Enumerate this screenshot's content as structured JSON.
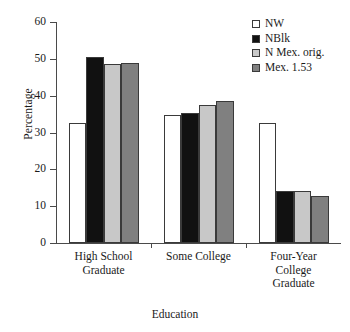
{
  "chart_data": {
    "type": "bar",
    "title": "",
    "xlabel": "Education",
    "ylabel": "Percentage",
    "categories": [
      "High School Graduate",
      "Some College",
      "Four-Year College Graduate"
    ],
    "category_lines": [
      [
        "High School",
        "Graduate"
      ],
      [
        "Some College"
      ],
      [
        "Four-Year",
        "College",
        "Graduate"
      ]
    ],
    "series": [
      {
        "name": "NW",
        "color": "#ffffff",
        "values": [
          32.6,
          34.8,
          32.6
        ]
      },
      {
        "name": "NBlk",
        "color": "#111111",
        "values": [
          50.6,
          35.4,
          14.0
        ]
      },
      {
        "name": "N Mex. orig.",
        "color": "#c8c8c8",
        "values": [
          48.5,
          37.5,
          14.1
        ]
      },
      {
        "name": "Mex. 1.53",
        "color": "#808080",
        "values": [
          48.9,
          38.5,
          12.7
        ]
      }
    ],
    "ylim": [
      0,
      60
    ],
    "yticks": [
      0,
      10,
      20,
      30,
      40,
      50,
      60
    ],
    "ytick_labels": [
      "0",
      "10",
      "20",
      "30",
      "40",
      "50",
      "60"
    ],
    "grid": false,
    "legend_position": "top-right",
    "bar_edge_color": "#3a3a3a",
    "axis_color": "#4a4a4a"
  },
  "legend": {
    "items": [
      {
        "label": "NW"
      },
      {
        "label": "NBlk"
      },
      {
        "label": "N Mex. orig."
      },
      {
        "label": "Mex. 1.53"
      }
    ]
  }
}
